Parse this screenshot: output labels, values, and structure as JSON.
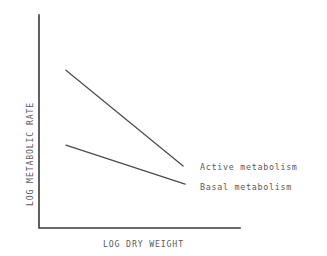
{
  "chart_data": {
    "type": "line",
    "title": "",
    "xlabel": "LOG DRY WEIGHT",
    "ylabel": "LOG METABOLIC RATE",
    "grid": false,
    "axes_style": "L-shaped spine, no tick marks, no tick labels",
    "xlim": [
      0,
      1
    ],
    "ylim": [
      0,
      1
    ],
    "legend_position": "inline-right-of-line-ends",
    "series": [
      {
        "name": "Active metabolism",
        "label": "Active metabolism",
        "color": "#4a4a4a",
        "x": [
          0.134,
          0.717
        ],
        "y": [
          0.741,
          0.291
        ],
        "description": "steeper negative slope"
      },
      {
        "name": "Basal metabolism",
        "label": "Basal metabolism",
        "color": "#4a4a4a",
        "x": [
          0.134,
          0.727
        ],
        "y": [
          0.389,
          0.206
        ],
        "description": "shallower negative slope"
      }
    ]
  },
  "figure": {
    "axis_color": "#3a3a3a",
    "text_color": "#5a5a5a",
    "background": "#ffffff"
  }
}
